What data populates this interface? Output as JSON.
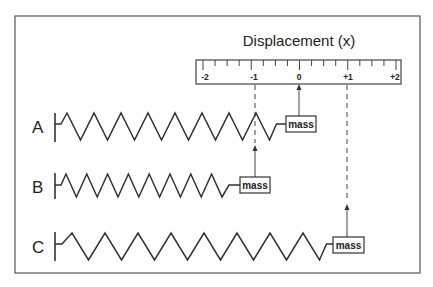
{
  "title": "Displacement (x)",
  "ruler": {
    "labels": [
      {
        "text": "-2",
        "value": -2
      },
      {
        "text": "-1",
        "value": -1
      },
      {
        "text": "0",
        "value": 0
      },
      {
        "text": "+1",
        "value": 1
      },
      {
        "text": "+2",
        "value": 2
      }
    ],
    "minor_ticks_per_unit": 4
  },
  "springs": [
    {
      "label": "A",
      "mass_label": "mass",
      "displacement": 0,
      "coils": 8,
      "state": "equilibrium"
    },
    {
      "label": "B",
      "mass_label": "mass",
      "displacement": -1,
      "coils": 8,
      "state": "compressed"
    },
    {
      "label": "C",
      "mass_label": "mass",
      "displacement": 1,
      "coils": 8,
      "state": "stretched"
    }
  ],
  "colors": {
    "line": "#333333",
    "frame": "#555555",
    "background": "#ffffff"
  }
}
